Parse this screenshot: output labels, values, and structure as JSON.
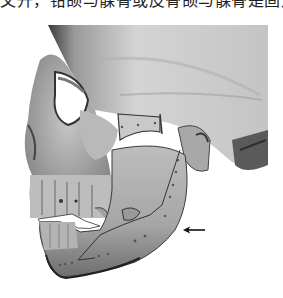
{
  "page": {
    "top_text_cropped": "文开，钳颌与髁骨或皮骨颌与髁骨是固定板。"
  },
  "figure": {
    "annotations": [
      {
        "type": "arrow",
        "direction": "left",
        "points_to": "mandibular angle fixation plate"
      }
    ],
    "colors": {
      "background": "#ffffff",
      "bone_light": "#d8d8d8",
      "bone_mid": "#a9a9a9",
      "bone_dark": "#4a4a4a",
      "arrow": "#111111"
    }
  }
}
